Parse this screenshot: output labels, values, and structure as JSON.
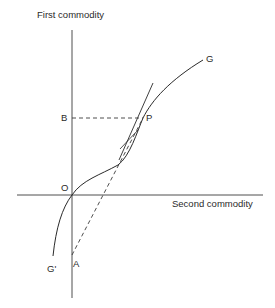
{
  "diagram": {
    "y_axis_label": "First commodity",
    "x_axis_label": "Second commodity",
    "points": {
      "origin": "O",
      "P": "P",
      "B": "B",
      "A": "A"
    },
    "curves": {
      "G": "G",
      "G_prime": "G'"
    },
    "colors": {
      "line": "#2a2a2a",
      "background": "#ffffff"
    }
  }
}
